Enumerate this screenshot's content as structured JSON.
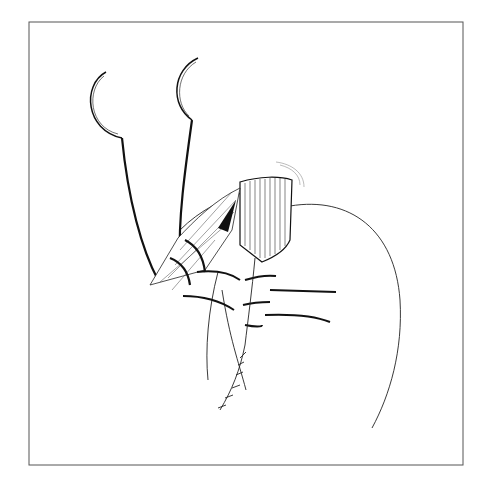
{
  "figure": {
    "type": "surgical line illustration",
    "colors": {
      "background": "#ffffff",
      "ink": "#1a1a1a",
      "frame": "#555555"
    },
    "elements": [
      {
        "name": "frame",
        "label": "figure frame"
      },
      {
        "name": "retractor-left",
        "label": "left retractor hook"
      },
      {
        "name": "retractor-right",
        "label": "right retractor hook"
      },
      {
        "name": "tissue-stump",
        "label": "striated tissue stump"
      },
      {
        "name": "vessel-bundle",
        "label": "ligated pedicle bundle"
      },
      {
        "name": "stomach-outline",
        "label": "stomach outline"
      },
      {
        "name": "suture-threads",
        "label": "suture threads"
      },
      {
        "name": "suture-line",
        "label": "interrupted suture line"
      }
    ]
  }
}
